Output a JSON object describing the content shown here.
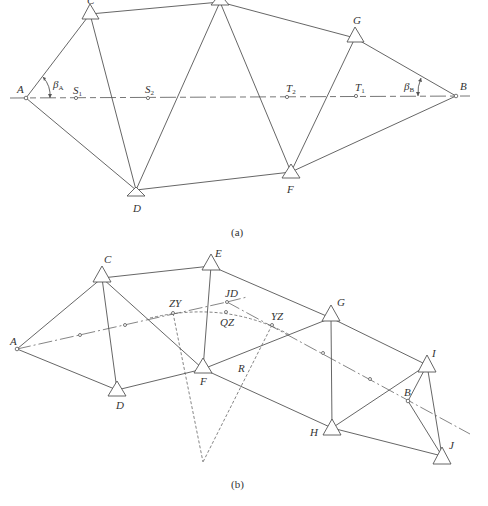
{
  "diagram_a": {
    "caption": "(a)",
    "points": {
      "A": {
        "label": "A",
        "x": 26,
        "y": 98
      },
      "B": {
        "label": "B",
        "x": 456,
        "y": 96
      },
      "C": {
        "label": "C",
        "x": 90,
        "y": 14
      },
      "E": {
        "label": "E",
        "x": 220,
        "y": 2
      },
      "G": {
        "label": "G",
        "x": 355,
        "y": 38
      },
      "D": {
        "label": "D",
        "x": 136,
        "y": 190
      },
      "F": {
        "label": "F",
        "x": 291,
        "y": 172
      },
      "S1": {
        "label": "S",
        "sub": "1",
        "x": 76,
        "y": 98
      },
      "S2": {
        "label": "S",
        "sub": "2",
        "x": 148,
        "y": 98
      },
      "T2": {
        "label": "T",
        "sub": "2",
        "x": 287,
        "y": 97
      },
      "T1": {
        "label": "T",
        "sub": "1",
        "x": 356,
        "y": 96
      }
    },
    "angles": [
      {
        "label": "β",
        "sub": "A"
      },
      {
        "label": "β",
        "sub": "B"
      }
    ]
  },
  "diagram_b": {
    "caption": "(b)",
    "points": {
      "A": {
        "label": "A",
        "x": 17,
        "y": 349
      },
      "C": {
        "label": "C",
        "x": 102,
        "y": 278
      },
      "E": {
        "label": "E",
        "x": 211,
        "y": 266
      },
      "G": {
        "label": "G",
        "x": 331,
        "y": 318
      },
      "D": {
        "label": "D",
        "x": 117,
        "y": 390
      },
      "F": {
        "label": "F",
        "x": 203,
        "y": 369
      },
      "H": {
        "label": "H",
        "x": 332,
        "y": 428
      },
      "I": {
        "label": "I",
        "x": 427,
        "y": 365
      },
      "J": {
        "label": "J",
        "x": 442,
        "y": 456
      },
      "B": {
        "label": "B",
        "x": 408,
        "y": 401
      },
      "ZY": {
        "label": "ZY",
        "x": 173,
        "y": 313
      },
      "JD": {
        "label": "JD",
        "x": 227,
        "y": 302
      },
      "QZ": {
        "label": "QZ",
        "x": 226,
        "y": 312
      },
      "YZ": {
        "label": "YZ",
        "x": 272,
        "y": 325
      },
      "R": {
        "label": "R"
      }
    }
  }
}
